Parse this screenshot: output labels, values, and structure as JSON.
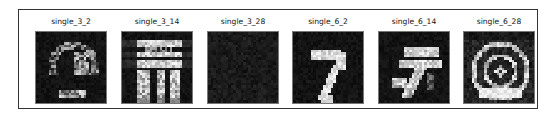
{
  "figure": {
    "panels": [
      {
        "title": "single_3_2",
        "description": "noisy dark image with faint bright ring-like blobs",
        "brightness": "low",
        "pattern": "ring"
      },
      {
        "title": "single_3_14",
        "description": "bright striped horizontal bands with blocky strokes below",
        "brightness": "high",
        "pattern": "stripes"
      },
      {
        "title": "single_3_28",
        "description": "almost uniformly dark noise",
        "brightness": "very-low",
        "pattern": "blank"
      },
      {
        "title": "single_6_2",
        "description": "digit resembling a seven/question-mark stroke",
        "brightness": "medium",
        "pattern": "seven"
      },
      {
        "title": "single_6_14",
        "description": "blurred digit with horizontal bands at top",
        "brightness": "medium",
        "pattern": "bands-seven"
      },
      {
        "title": "single_6_28",
        "description": "concentric arc pattern, bright at top and bottom",
        "brightness": "high",
        "pattern": "arcs"
      }
    ]
  }
}
